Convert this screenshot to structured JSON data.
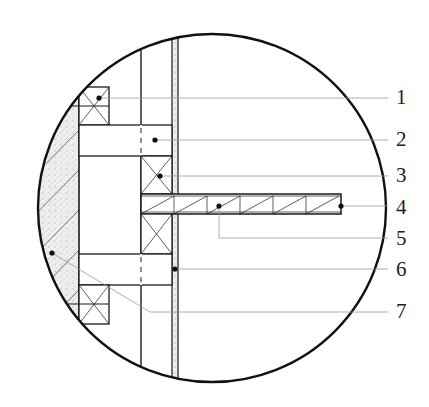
{
  "diagram": {
    "type": "construction-detail-section",
    "colors": {
      "line": "#1a1a1a",
      "leader": "#9a9a9a",
      "fill_stipple": "#e6e6e6",
      "background": "#ffffff"
    },
    "callouts": [
      {
        "number": "1",
        "y": 98
      },
      {
        "number": "2",
        "y": 140
      },
      {
        "number": "3",
        "y": 176
      },
      {
        "number": "4",
        "y": 208
      },
      {
        "number": "5",
        "y": 239
      },
      {
        "number": "6",
        "y": 270
      },
      {
        "number": "7",
        "y": 312
      }
    ]
  }
}
